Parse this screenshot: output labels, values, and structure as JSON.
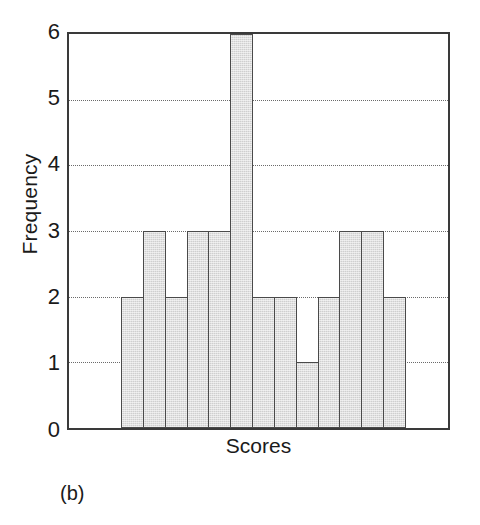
{
  "chart_data": {
    "type": "bar",
    "title": "",
    "subtitle": "",
    "xlabel": "Scores",
    "ylabel": "Frequency",
    "panel_label": "(b)",
    "categories": [
      "1",
      "2",
      "3",
      "4",
      "5",
      "6",
      "7",
      "8",
      "9",
      "10",
      "11",
      "12",
      "13"
    ],
    "values": [
      2,
      3,
      2,
      3,
      3,
      6,
      2,
      2,
      1,
      2,
      3,
      3,
      2
    ],
    "ylim": [
      0,
      6
    ],
    "ytick_labels": [
      "0",
      "1",
      "2",
      "3",
      "4",
      "5",
      "6"
    ],
    "ytick_values": [
      0,
      1,
      2,
      3,
      4,
      5,
      6
    ],
    "gridline_values": [
      1,
      2,
      3,
      4,
      5
    ],
    "grid": "horizontal-dotted",
    "legend": "none",
    "legend_position": "none",
    "bar_gap": 0,
    "bar_fill_color": "#cfcfcf",
    "bar_edge_color": "#4a4a4a",
    "axis_color": "#3a3a3a",
    "grid_color": "#6b6b6b",
    "background_color": "#ffffff"
  }
}
